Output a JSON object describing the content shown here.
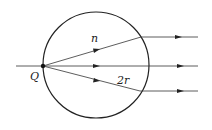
{
  "diagram": {
    "type": "optics-ray-diagram",
    "labels": {
      "point": "Q",
      "index": "n",
      "diameter": "2r"
    },
    "colors": {
      "stroke": "#222222",
      "background": "#ffffff"
    },
    "circle": {
      "cx": 96,
      "cy": 65,
      "r": 53
    },
    "rays": [
      {
        "name": "upper-ray",
        "inside": [
          43,
          66,
          141,
          37
        ],
        "outside": [
          141,
          37,
          198,
          37
        ]
      },
      {
        "name": "center-ray",
        "inside": [
          16,
          66,
          149,
          66
        ],
        "outside": [
          149,
          66,
          198,
          66
        ]
      },
      {
        "name": "lower-ray",
        "inside": [
          43,
          66,
          140,
          91
        ],
        "outside": [
          140,
          91,
          198,
          91
        ]
      }
    ]
  }
}
